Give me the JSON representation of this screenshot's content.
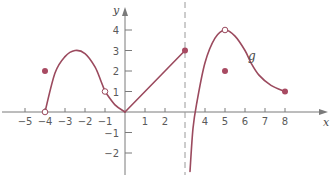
{
  "chart_data": {
    "type": "line",
    "title": "",
    "xlabel": "x",
    "ylabel": "y",
    "function_label": "g",
    "xlim": [
      -5.8,
      9.2
    ],
    "ylim": [
      -2.9,
      4.6
    ],
    "x_ticks": [
      -5,
      -4,
      -3,
      -2,
      -1,
      1,
      2,
      4,
      5,
      6,
      7,
      8
    ],
    "y_ticks": [
      -2,
      -1,
      1,
      2,
      3,
      4
    ],
    "vertical_asymptote": 3,
    "grid": false,
    "colors": {
      "curve": "#9b4a5e",
      "axis": "#7a7a7a",
      "dashed": "#9a9a9a",
      "dot": "#a84a62"
    },
    "segments": [
      {
        "name": "hump-left",
        "points": [
          [
            -4,
            0
          ],
          [
            -3.5,
            1.9
          ],
          [
            -3,
            2.7
          ],
          [
            -2.5,
            3.0
          ],
          [
            -2,
            2.85
          ],
          [
            -1.5,
            2.2
          ],
          [
            -1.2,
            1.5
          ],
          [
            -1,
            1
          ]
        ]
      },
      {
        "name": "dip-to-origin",
        "points": [
          [
            -1,
            1
          ],
          [
            -0.5,
            0.35
          ],
          [
            0,
            0
          ]
        ]
      },
      {
        "name": "line-to-3",
        "points": [
          [
            0,
            0
          ],
          [
            3,
            3
          ]
        ]
      },
      {
        "name": "right-branch",
        "points": [
          [
            3.25,
            -2.9
          ],
          [
            3.4,
            -0.8
          ],
          [
            3.6,
            0.5
          ],
          [
            4,
            2.4
          ],
          [
            4.5,
            3.6
          ],
          [
            5,
            4
          ],
          [
            5.5,
            3.7
          ],
          [
            6,
            3.0
          ],
          [
            6.3,
            2.4
          ],
          [
            6.7,
            1.8
          ],
          [
            7.3,
            1.3
          ],
          [
            8,
            1
          ]
        ]
      }
    ],
    "open_points": [
      [
        -4,
        0
      ],
      [
        -1,
        1
      ],
      [
        5,
        4
      ]
    ],
    "closed_points": [
      [
        -4,
        2
      ],
      [
        3,
        3
      ],
      [
        5,
        2
      ],
      [
        8,
        1
      ]
    ]
  }
}
